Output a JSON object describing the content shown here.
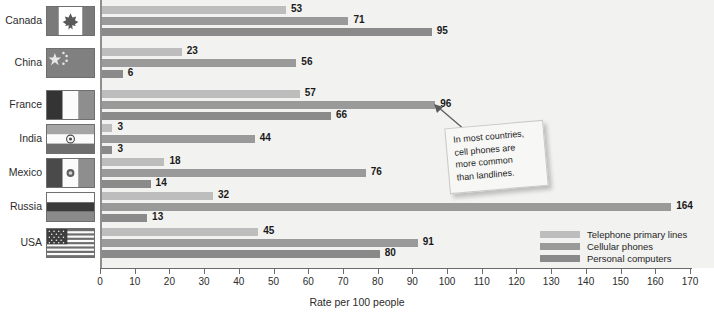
{
  "chart_data": {
    "type": "bar",
    "orientation": "horizontal",
    "title": "",
    "xlabel": "Rate per 100 people",
    "ylabel": "",
    "xlim": [
      0,
      170
    ],
    "xticks": [
      0,
      10,
      20,
      30,
      40,
      50,
      60,
      70,
      80,
      90,
      100,
      110,
      120,
      130,
      140,
      150,
      160,
      170
    ],
    "grid": false,
    "legend_position": "bottom-right",
    "categories": [
      "Canada",
      "China",
      "France",
      "India",
      "Mexico",
      "Russia",
      "USA"
    ],
    "series": [
      {
        "name": "Telephone primary lines",
        "color": "#bdbdbd",
        "values": [
          53,
          23,
          57,
          3,
          18,
          32,
          45
        ]
      },
      {
        "name": "Cellular phones",
        "color": "#9a9a9a",
        "values": [
          71,
          56,
          96,
          44,
          76,
          164,
          91
        ]
      },
      {
        "name": "Personal computers",
        "color": "#8a8a8a",
        "values": [
          95,
          6,
          66,
          3,
          14,
          13,
          80
        ]
      }
    ],
    "annotations": [
      {
        "text": "In most countries, cell phones are more common than landlines.",
        "lines": [
          "In most countries,",
          "cell phones are",
          "more common",
          "than landlines."
        ],
        "points_to": {
          "category": "France",
          "series": "Cellular phones",
          "value": 96
        }
      }
    ]
  },
  "axis": {
    "title": "Rate per 100 people",
    "tick_labels": [
      "0",
      "10",
      "20",
      "30",
      "40",
      "50",
      "60",
      "70",
      "80",
      "90",
      "100",
      "110",
      "120",
      "130",
      "140",
      "150",
      "160",
      "170"
    ]
  },
  "legend": {
    "items": [
      {
        "label": "Telephone primary lines",
        "color": "#bdbdbd"
      },
      {
        "label": "Cellular phones",
        "color": "#9a9a9a"
      },
      {
        "label": "Personal computers",
        "color": "#8a8a8a"
      }
    ]
  },
  "callout": {
    "line1": "In most countries,",
    "line2": "cell phones are",
    "line3": "more common",
    "line4": "than landlines."
  },
  "rows": [
    {
      "country": "Canada",
      "flag": "flag-canada",
      "values": [
        "53",
        "71",
        "95"
      ]
    },
    {
      "country": "China",
      "flag": "flag-china",
      "values": [
        "23",
        "56",
        "6"
      ]
    },
    {
      "country": "France",
      "flag": "flag-france",
      "values": [
        "57",
        "96",
        "66"
      ]
    },
    {
      "country": "India",
      "flag": "flag-india",
      "values": [
        "3",
        "44",
        "3"
      ]
    },
    {
      "country": "Mexico",
      "flag": "flag-mexico",
      "values": [
        "18",
        "76",
        "14"
      ]
    },
    {
      "country": "Russia",
      "flag": "flag-russia",
      "values": [
        "32",
        "164",
        "13"
      ]
    },
    {
      "country": "USA",
      "flag": "flag-usa",
      "values": [
        "45",
        "91",
        "80"
      ]
    }
  ]
}
